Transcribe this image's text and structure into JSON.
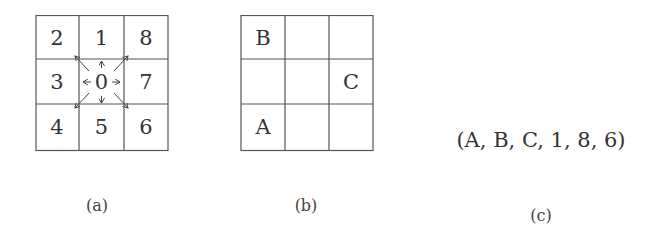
{
  "panel_a": {
    "caption": "(a)",
    "cells": [
      [
        "2",
        "1",
        "8"
      ],
      [
        "3",
        "0",
        "7"
      ],
      [
        "4",
        "5",
        "6"
      ]
    ],
    "center_arrows": [
      "up",
      "down",
      "left",
      "right",
      "up-left",
      "up-right",
      "down-left",
      "down-right"
    ]
  },
  "panel_b": {
    "caption": "(b)",
    "cells": [
      [
        "B",
        "",
        ""
      ],
      [
        "",
        "",
        "C"
      ],
      [
        "A",
        "",
        ""
      ]
    ]
  },
  "panel_c": {
    "caption": "(c)",
    "tuple": "(A, B, C, 1, 8, 6)"
  },
  "colors": {
    "line": "#555555",
    "text": "#333333",
    "background": "#ffffff"
  }
}
